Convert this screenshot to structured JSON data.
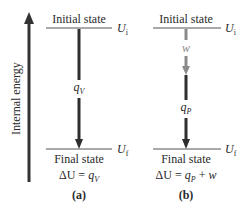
{
  "axis": {
    "label": "Internal energy"
  },
  "panel_a": {
    "initial_label": "Initial state",
    "final_label": "Final state",
    "u_initial": {
      "symbol": "U",
      "subscript": "i"
    },
    "u_final": {
      "symbol": "U",
      "subscript": "f"
    },
    "heat": {
      "symbol": "q",
      "subscript": "V"
    },
    "equation": {
      "lhs": "ΔU = ",
      "q": "q",
      "q_sub": "V",
      "rest": ""
    },
    "caption": "(a)"
  },
  "panel_b": {
    "initial_label": "Initial state",
    "final_label": "Final state",
    "u_initial": {
      "symbol": "U",
      "subscript": "i"
    },
    "u_final": {
      "symbol": "U",
      "subscript": "f"
    },
    "work": {
      "symbol": "w"
    },
    "heat": {
      "symbol": "q",
      "subscript": "P"
    },
    "equation": {
      "lhs": "ΔU = ",
      "q": "q",
      "q_sub": "P",
      "plus": " + ",
      "w": "w"
    },
    "caption": "(b)"
  },
  "colors": {
    "line": "#333333",
    "work_arrow": "#8a8a8a",
    "heat_arrow": "#2e2e2e"
  }
}
